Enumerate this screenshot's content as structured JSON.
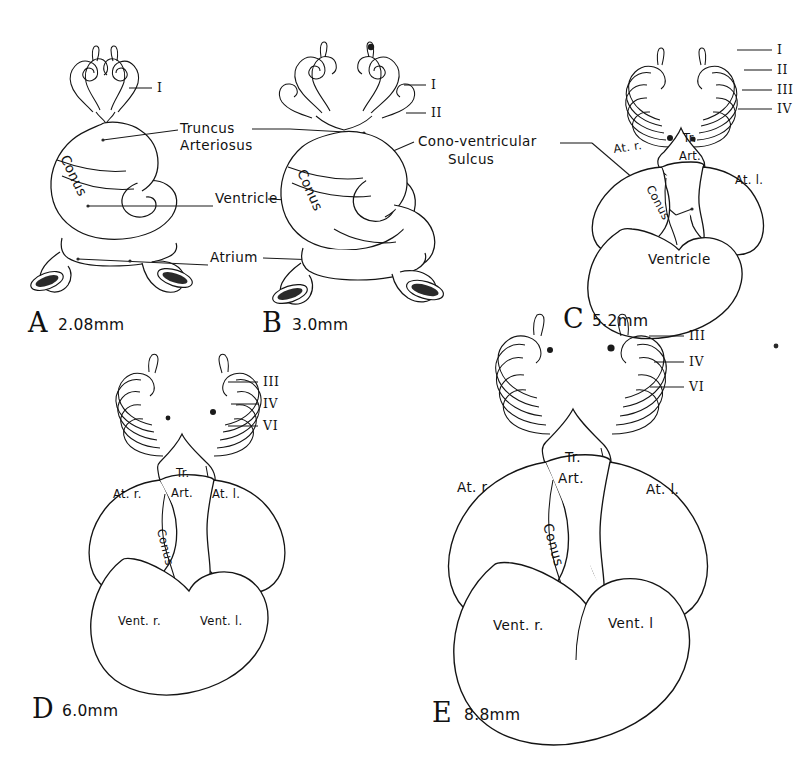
{
  "figure": {
    "background_color": "#ffffff",
    "ink_color": "#141414",
    "panel_count": 5
  },
  "callouts": {
    "truncus_line1": "Truncus",
    "truncus_line2": "Arteriosus",
    "ventricle": "Ventricle",
    "atrium": "Atrium",
    "sulcus_line1": "Cono-ventricular",
    "sulcus_line2": "Sulcus"
  },
  "panels": [
    {
      "id": "A",
      "letter": "A",
      "size": "2.08mm",
      "arch_labels": [
        "I"
      ],
      "inner_labels": [
        "Conus"
      ],
      "callout_labels": [
        "Truncus Arteriosus",
        "Ventricle",
        "Atrium"
      ]
    },
    {
      "id": "B",
      "letter": "B",
      "size": "3.0mm",
      "arch_labels": [
        "I",
        "II"
      ],
      "inner_labels": [
        "Conus"
      ],
      "callout_labels": [
        "Truncus Arteriosus",
        "Ventricle",
        "Atrium",
        "Cono-ventricular Sulcus"
      ]
    },
    {
      "id": "C",
      "letter": "C",
      "size": "5.2mm",
      "arch_labels": [
        "I",
        "II",
        "III",
        "IV"
      ],
      "inner_labels": [
        "At. r.",
        "Tr.",
        "Art.",
        "At. l.",
        "Conus",
        "Ventricle"
      ],
      "callout_labels": [
        "Cono-ventricular Sulcus"
      ]
    },
    {
      "id": "D",
      "letter": "D",
      "size": "6.0mm",
      "arch_labels": [
        "III",
        "IV",
        "VI"
      ],
      "inner_labels": [
        "At. r.",
        "Tr.",
        "Art.",
        "At. l.",
        "Conus",
        "Vent. r.",
        "Vent. l."
      ],
      "callout_labels": []
    },
    {
      "id": "E",
      "letter": "E",
      "size": "8.8mm",
      "arch_labels": [
        "III",
        "IV",
        "VI"
      ],
      "inner_labels": [
        "At. r",
        "Tr.",
        "Art.",
        "At. l.",
        "Conus",
        "Vent. r.",
        "Vent. l"
      ],
      "callout_labels": []
    }
  ],
  "panelA": {
    "letter": "A",
    "size": "2.08mm",
    "arch_I": "I",
    "conus": "Conus"
  },
  "panelB": {
    "letter": "B",
    "size": "3.0mm",
    "arch_I": "I",
    "arch_II": "II",
    "conus": "Conus"
  },
  "panelC": {
    "letter": "C",
    "size": "5.2mm",
    "arch_I": "I",
    "arch_II": "II",
    "arch_III": "III",
    "arch_IV": "IV",
    "at_r": "At. r.",
    "tr": "Tr.",
    "art": "Art.",
    "at_l": "At. l.",
    "conus": "Conus",
    "ventricle": "Ventricle"
  },
  "panelD": {
    "letter": "D",
    "size": "6.0mm",
    "arch_III": "III",
    "arch_IV": "IV",
    "arch_VI": "VI",
    "at_r": "At. r.",
    "tr": "Tr.",
    "art": "Art.",
    "at_l": "At. l.",
    "conus": "Conus",
    "vent_r": "Vent. r.",
    "vent_l": "Vent. l."
  },
  "panelE": {
    "letter": "E",
    "size": "8.8mm",
    "arch_III": "III",
    "arch_IV": "IV",
    "arch_VI": "VI",
    "at_r": "At. r",
    "tr": "Tr.",
    "art": "Art.",
    "at_l": "At. l.",
    "conus": "Conus",
    "vent_r": "Vent. r.",
    "vent_l": "Vent. l"
  }
}
